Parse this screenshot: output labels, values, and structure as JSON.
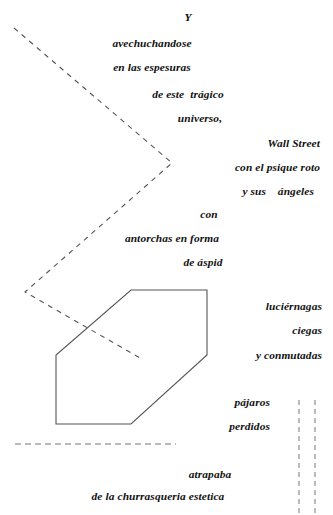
{
  "page": {
    "width": 333,
    "height": 515,
    "background_color": "#ffffff",
    "ink_color": "#111111",
    "line_color": "#555555"
  },
  "poem": {
    "language": "es",
    "lines": [
      {
        "id": "l1",
        "text": "Y",
        "x": 160,
        "y": 11,
        "w": 56,
        "align": "center"
      },
      {
        "id": "l2",
        "text": "avechuchandose",
        "x": 96,
        "y": 37,
        "w": 112,
        "align": "center"
      },
      {
        "id": "l3",
        "text": "en las espesuras",
        "x": 96,
        "y": 61,
        "w": 112,
        "align": "center"
      },
      {
        "id": "l4",
        "text": "de este  trágico",
        "x": 140,
        "y": 88,
        "w": 96,
        "align": "center"
      },
      {
        "id": "l5",
        "text": "universo,",
        "x": 168,
        "y": 112,
        "w": 64,
        "align": "center"
      },
      {
        "id": "l6",
        "text": "Wall Street",
        "x": 212,
        "y": 137,
        "w": 108,
        "align": "right"
      },
      {
        "id": "l7",
        "text": "con el psique roto",
        "x": 196,
        "y": 161,
        "w": 124,
        "align": "right"
      },
      {
        "id": "l8",
        "text": "y sus    ángeles",
        "x": 196,
        "y": 185,
        "w": 118,
        "align": "right"
      },
      {
        "id": "l9",
        "text": "con",
        "x": 188,
        "y": 208,
        "w": 42,
        "align": "center"
      },
      {
        "id": "l10",
        "text": "antorchas en forma",
        "x": 110,
        "y": 232,
        "w": 124,
        "align": "center"
      },
      {
        "id": "l11",
        "text": "de áspid",
        "x": 174,
        "y": 256,
        "w": 58,
        "align": "center"
      },
      {
        "id": "l12",
        "text": "luciérnagas",
        "x": 212,
        "y": 300,
        "w": 110,
        "align": "right"
      },
      {
        "id": "l13",
        "text": "ciegas",
        "x": 212,
        "y": 324,
        "w": 110,
        "align": "right"
      },
      {
        "id": "l14",
        "text": "y conmutadas",
        "x": 200,
        "y": 349,
        "w": 122,
        "align": "right"
      },
      {
        "id": "l15",
        "text": "pájaros",
        "x": 180,
        "y": 396,
        "w": 90,
        "align": "right"
      },
      {
        "id": "l16",
        "text": "perdidos",
        "x": 180,
        "y": 420,
        "w": 90,
        "align": "right"
      },
      {
        "id": "l17",
        "text": "atrapaba",
        "x": 178,
        "y": 468,
        "w": 64,
        "align": "center"
      },
      {
        "id": "l18",
        "text": "de la churrasqueria estetica",
        "x": 76,
        "y": 490,
        "w": 164,
        "align": "center"
      }
    ]
  },
  "figures": {
    "hexagon": {
      "name": "hexagon-outline",
      "points": "131,290 207,290 207,355 131,424 56,424 56,355",
      "stroke": "#555555",
      "stroke_width": 1.1,
      "fill": "none"
    },
    "zigzag_dashed": {
      "name": "zigzag-dashed-line",
      "points": "14,28 172,163 25,292 140,358",
      "stroke": "#555555",
      "stroke_width": 1.1,
      "dash": "5 5",
      "fill": "none"
    },
    "horizontal_dashed": {
      "name": "horizontal-dashed-line",
      "x1": 15,
      "y1": 444,
      "x2": 176,
      "y2": 444,
      "stroke": "#777777",
      "stroke_width": 1.0,
      "dash": "6 4"
    },
    "vertical_dashed_left": {
      "name": "vertical-dashed-line-left",
      "x1": 299,
      "y1": 400,
      "x2": 299,
      "y2": 513,
      "stroke": "#777777",
      "stroke_width": 1.0,
      "dash": "5 4"
    },
    "vertical_dashed_right": {
      "name": "vertical-dashed-line-right",
      "x1": 315,
      "y1": 400,
      "x2": 315,
      "y2": 513,
      "stroke": "#777777",
      "stroke_width": 1.0,
      "dash": "5 4"
    }
  }
}
